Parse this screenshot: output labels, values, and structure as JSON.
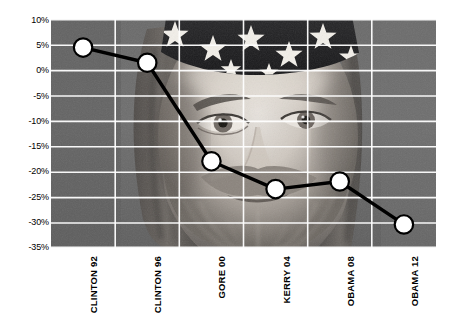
{
  "chart_data": {
    "type": "line",
    "title": "",
    "subtitle": "",
    "xlabel": "",
    "ylabel": "",
    "categories": [
      "CLINTON 92",
      "CLINTON 96",
      "GORE 00",
      "KERRY 04",
      "OBAMA 08",
      "OBAMA 12"
    ],
    "values": [
      4.5,
      1.5,
      -18.0,
      -23.5,
      -22.0,
      -30.5
    ],
    "series": [
      {
        "name": "",
        "values": [
          4.5,
          1.5,
          -18.0,
          -23.5,
          -22.0,
          -30.5
        ]
      }
    ],
    "ylim": [
      -35,
      10
    ],
    "ytick_labels": [
      "10%",
      "5%",
      "0%",
      "-5%",
      "-10%",
      "-15%",
      "-20%",
      "-25%",
      "-30%",
      "-35%"
    ],
    "ytick_values": [
      10,
      5,
      0,
      -5,
      -10,
      -15,
      -20,
      -25,
      -30,
      -35
    ],
    "grid": true,
    "grid_color": "#ffffff",
    "legend": "none",
    "line_color": "#000000",
    "marker_fill": "#ffffff",
    "marker_edge": "#000000",
    "background_image": "grayscale-photo-bearded-man-star-bandana",
    "plot_background_color": "#6e6e6e",
    "annotations": []
  },
  "icons": {
    "background_photo": "portrait-photo"
  }
}
